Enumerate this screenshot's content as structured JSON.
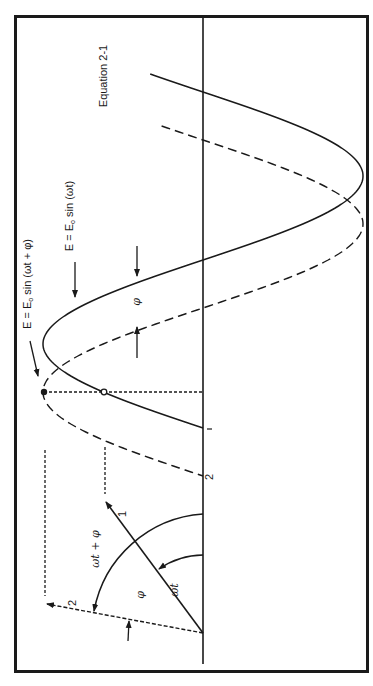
{
  "figure": {
    "equation_label": "Equation 2-1",
    "curve_solid_label": {
      "lhs": "E = E",
      "sub": "o",
      "rhs": " sin (ωt + φ)"
    },
    "curve_dashed_label": {
      "lhs": "E = E",
      "sub": "o",
      "rhs": " sin (ωt)"
    },
    "phase_gap_label": "φ",
    "phasor_labels": {
      "phasor_1": "1",
      "phasor_2": "2",
      "axis_tick_1": "1",
      "axis_tick_2": "2",
      "arc_large": "ωt + φ",
      "arc_small": "ωt",
      "angle_between": "φ"
    },
    "colors": {
      "ink": "#1a1a1a",
      "background": "#ffffff"
    }
  }
}
